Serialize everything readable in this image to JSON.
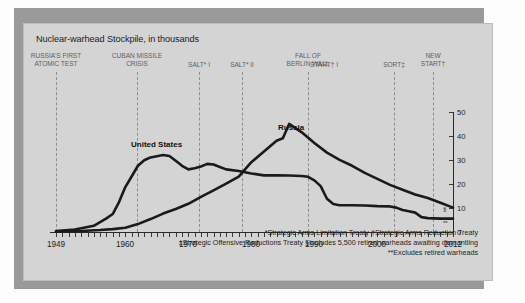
{
  "chart": {
    "title": "Nuclear-warhead Stockpile, in thousands",
    "series_labels": {
      "us": "United States",
      "russia": "Russia"
    },
    "marker_russia": "§",
    "marker_us": "**"
  },
  "events": [
    {
      "label": "RUSSIA'S FIRST\nATOMIC TEST",
      "year": 1949
    },
    {
      "label": "CUBAN MISSILE\nCRISIS",
      "year": 1962
    },
    {
      "label": "SALT* I",
      "year": 1972
    },
    {
      "label": "SALT* II",
      "year": 1979
    },
    {
      "label": "FALL OF\nBERLIN WALL",
      "year": 1989
    },
    {
      "label": "START† I",
      "year": 1991
    },
    {
      "label": "SORT‡",
      "year": 2002
    },
    {
      "label": "NEW\nSTART†",
      "year": 2010
    }
  ],
  "footnotes": [
    "*Strategic Arms Limitation Treaty   †Strategic Arms Reduction Treaty",
    "‡Strategic Offensive Reductions Treaty    §Includes 5,500 retired warheads awaiting dismantling",
    "**Excludes retired warheads"
  ],
  "source": "Source: Bulletin of the Atomic Scientists, as depicted in The Economist, Feb. 23 (2013).",
  "source_italic": "The Economist",
  "chart_data": {
    "type": "line",
    "title": "Nuclear-warhead Stockpile, in thousands",
    "xlabel": "",
    "ylabel": "thousands of warheads",
    "xlim": [
      1949,
      2012
    ],
    "ylim": [
      0,
      55
    ],
    "yticks": [
      0,
      10,
      20,
      30,
      40,
      50
    ],
    "xticks": [
      1949,
      1960,
      1970,
      1980,
      1990,
      2000,
      2012
    ],
    "grid": false,
    "legend": "inline-labels",
    "series": [
      {
        "name": "United States",
        "x": [
          1949,
          1952,
          1955,
          1957,
          1958,
          1959,
          1960,
          1961,
          1962,
          1963,
          1964,
          1966,
          1967,
          1968,
          1969,
          1970,
          1971,
          1972,
          1973,
          1974,
          1975,
          1976,
          1978,
          1980,
          1982,
          1984,
          1986,
          1988,
          1989,
          1990,
          1991,
          1992,
          1993,
          1994,
          1996,
          1998,
          2000,
          2002,
          2003,
          2004,
          2005,
          2006,
          2007,
          2008,
          2010,
          2012
        ],
        "values": [
          0.2,
          0.8,
          2.4,
          5.5,
          7.3,
          12.3,
          18.6,
          23.0,
          27.5,
          29.8,
          31.0,
          32.0,
          31.6,
          29.6,
          27.5,
          26.0,
          26.5,
          27.2,
          28.3,
          28.0,
          27.0,
          26.0,
          25.3,
          24.3,
          23.5,
          23.5,
          23.4,
          23.2,
          22.9,
          21.4,
          19.0,
          13.7,
          11.5,
          11.0,
          11.0,
          10.9,
          10.6,
          10.5,
          10.0,
          9.0,
          8.5,
          7.9,
          6.0,
          5.6,
          5.4,
          5.4
        ]
      },
      {
        "name": "Russia",
        "x": [
          1949,
          1953,
          1956,
          1958,
          1960,
          1962,
          1964,
          1966,
          1968,
          1970,
          1972,
          1974,
          1976,
          1978,
          1980,
          1982,
          1984,
          1985,
          1986,
          1988,
          1990,
          1992,
          1994,
          1996,
          1998,
          2000,
          2002,
          2004,
          2006,
          2008,
          2010,
          2012
        ],
        "values": [
          0.0,
          0.2,
          0.6,
          1.0,
          1.6,
          3.1,
          5.2,
          7.5,
          9.4,
          11.6,
          14.5,
          17.2,
          20.0,
          23.0,
          29.0,
          33.5,
          38.0,
          39.0,
          45.0,
          41.5,
          37.0,
          33.0,
          30.0,
          27.5,
          24.5,
          22.0,
          19.5,
          17.5,
          15.5,
          14.0,
          12.0,
          10.0
        ]
      }
    ]
  }
}
